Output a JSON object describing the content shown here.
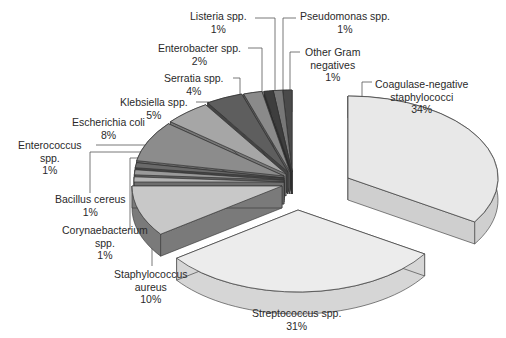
{
  "chart_data": {
    "type": "pie",
    "style": "3d-exploded",
    "title": "",
    "unit": "%",
    "slices": [
      {
        "label": "Coagulase-negative staphylococci",
        "value": 34,
        "color": "#e8e8e8",
        "side": "#cfcfcf"
      },
      {
        "label": "Streptococcus spp.",
        "value": 31,
        "color": "#ececec",
        "side": "#d6d6d6"
      },
      {
        "label": "Staphylococcus aureus",
        "value": 10,
        "color": "#c8c8c8",
        "side": "#7a7a7a"
      },
      {
        "label": "Corynaebacterium spp.",
        "value": 1,
        "color": "#b4b4b4",
        "side": "#6e6e6e"
      },
      {
        "label": "Bacillus cereus",
        "value": 1,
        "color": "#9a9a9a",
        "side": "#5e5e5e"
      },
      {
        "label": "Enterococcus spp.",
        "value": 1,
        "color": "#6a6a6a",
        "side": "#444444"
      },
      {
        "label": "Escherichia coli",
        "value": 8,
        "color": "#8c8c8c",
        "side": "#6a6a6a"
      },
      {
        "label": "Klebsiella spp.",
        "value": 5,
        "color": "#a6a6a6",
        "side": "#777777"
      },
      {
        "label": "Serratia spp.",
        "value": 4,
        "color": "#5e5e5e",
        "side": "#444444"
      },
      {
        "label": "Enterobacter spp.",
        "value": 2,
        "color": "#8a8a8a",
        "side": "#5a5a5a"
      },
      {
        "label": "Listeria spp.",
        "value": 1,
        "color": "#3e3e3e",
        "side": "#2a2a2a"
      },
      {
        "label": "Pseudomonas spp.",
        "value": 1,
        "color": "#777777",
        "side": "#4a4a4a"
      },
      {
        "label": "Other Gram negatives",
        "value": 1,
        "color": "#4a4a4a",
        "side": "#333333"
      }
    ],
    "legend": "none (leader-line labels)"
  },
  "labels": {
    "coag": {
      "l1": "Coagulase-negative",
      "l2": "staphylococci",
      "pct": "34%"
    },
    "strep": {
      "l1": "Streptococcus spp.",
      "pct": "31%"
    },
    "saureus": {
      "l1": "Staphylococcus",
      "l2": "aureus",
      "pct": "10%"
    },
    "coryn": {
      "l1": "Corynaebacterium",
      "l2": "spp.",
      "pct": "1%"
    },
    "bacillus": {
      "l1": "Bacillus cereus",
      "pct": "1%"
    },
    "entero": {
      "l1": "Enterococcus",
      "l2": "spp.",
      "pct": "1%"
    },
    "ecoli": {
      "l1": "Escherichia coli",
      "pct": "8%"
    },
    "kleb": {
      "l1": "Klebsiella spp.",
      "pct": "5%"
    },
    "serr": {
      "l1": "Serratia spp.",
      "pct": "4%"
    },
    "enterob": {
      "l1": "Enterobacter spp.",
      "pct": "2%"
    },
    "list": {
      "l1": "Listeria spp.",
      "pct": "1%"
    },
    "pseudo": {
      "l1": "Pseudomonas spp.",
      "pct": "1%"
    },
    "other": {
      "l1": "Other Gram",
      "l2": "negatives",
      "pct": "1%"
    }
  }
}
